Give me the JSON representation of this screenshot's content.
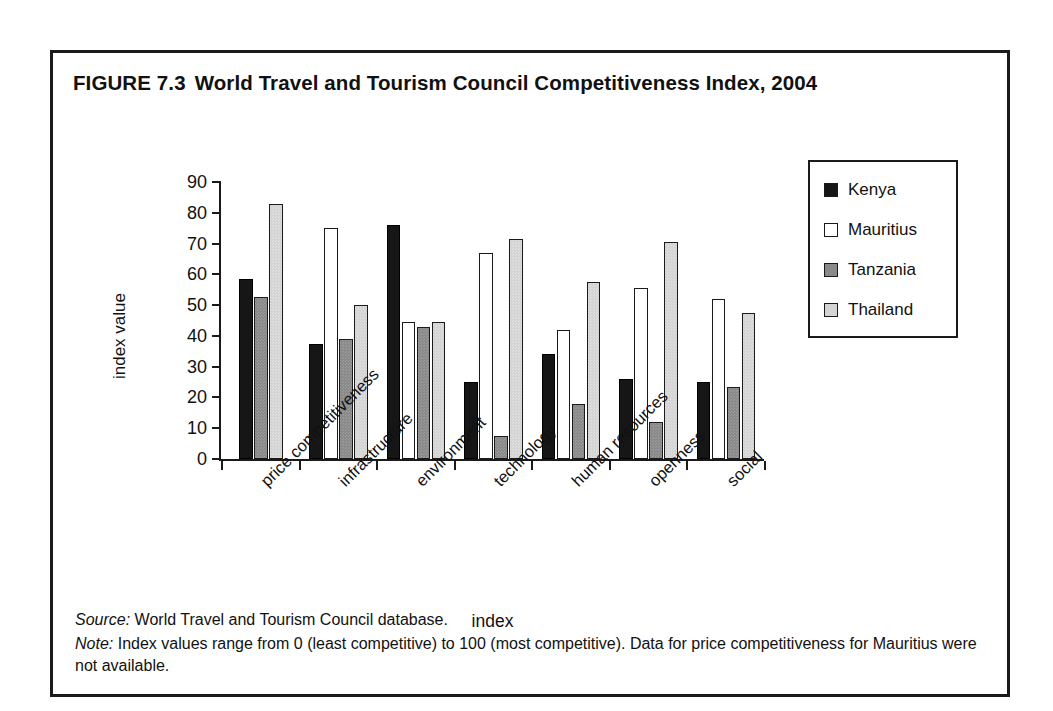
{
  "figure": {
    "number": "FIGURE 7.3",
    "title": "World Travel and Tourism Council Competitiveness Index, 2004"
  },
  "notes": {
    "source_lead": "Source:",
    "source_text": " World Travel and Tourism Council database.",
    "note_lead": "Note:",
    "note_text": " Index values range from 0 (least competitive) to 100 (most competitive). Data for price competitiveness for Mauritius were not available."
  },
  "legend": {
    "entries": [
      {
        "label": "Kenya",
        "swatch": "black-square-icon"
      },
      {
        "label": "Mauritius",
        "swatch": "white-square-icon"
      },
      {
        "label": "Tanzania",
        "swatch": "dark-gray-square-icon"
      },
      {
        "label": "Thailand",
        "swatch": "light-gray-square-icon"
      }
    ]
  },
  "colors": {
    "kenya": "#161616",
    "mauritius": "#ffffff",
    "tanzania": "#8a8a8a",
    "thailand": "#d4d4d4",
    "axis": "#1a1a1a",
    "frame": "#1a1a1a"
  },
  "chart_data": {
    "type": "bar",
    "title": "World Travel and Tourism Council Competitiveness Index, 2004",
    "xlabel": "index",
    "ylabel": "index value",
    "ylim": [
      0,
      90
    ],
    "yticks": [
      0,
      10,
      20,
      30,
      40,
      50,
      60,
      70,
      80,
      90
    ],
    "grid": false,
    "legend_position": "right",
    "categories": [
      "price competitiveness",
      "infrastructure",
      "environment",
      "technology",
      "human resources",
      "openness",
      "social"
    ],
    "series": [
      {
        "name": "Kenya",
        "values": [
          58.5,
          37.5,
          76.0,
          25.0,
          34.0,
          26.0,
          25.0
        ]
      },
      {
        "name": "Mauritius",
        "values": [
          null,
          75.0,
          44.5,
          67.0,
          42.0,
          55.5,
          52.0
        ]
      },
      {
        "name": "Tanzania",
        "values": [
          52.5,
          39.0,
          43.0,
          7.5,
          18.0,
          12.0,
          23.5
        ]
      },
      {
        "name": "Thailand",
        "values": [
          83.0,
          50.0,
          44.5,
          71.5,
          57.5,
          70.5,
          47.5
        ]
      }
    ]
  }
}
